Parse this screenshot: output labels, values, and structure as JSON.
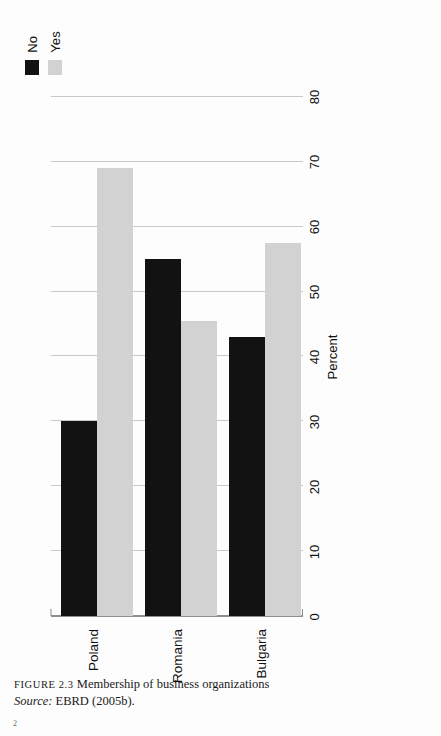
{
  "caption": {
    "figure_label": "FIGURE 2.3",
    "title": "Membership of business organizations",
    "source_label": "Source:",
    "source_text": "EBRD (2005b).",
    "folio": "2"
  },
  "legend": {
    "position": "top-right",
    "items": [
      {
        "label": "No",
        "color": "#121212"
      },
      {
        "label": "Yes",
        "color": "#d2d2d2"
      }
    ]
  },
  "axis": {
    "title": "Percent",
    "ticks": [
      "0",
      "10",
      "20",
      "30",
      "40",
      "50",
      "60",
      "70",
      "80"
    ]
  },
  "chart_data": {
    "type": "bar",
    "orientation": "horizontal",
    "title": "Membership of business organizations",
    "xlabel": "Percent",
    "ylabel": "",
    "xlim": [
      0,
      80
    ],
    "grid": true,
    "legend_position": "top right",
    "categories": [
      "Poland",
      "Romania",
      "Bulgaria"
    ],
    "series": [
      {
        "name": "No",
        "color": "#121212",
        "values": [
          30,
          55,
          43
        ]
      },
      {
        "name": "Yes",
        "color": "#d2d2d2",
        "values": [
          69,
          45.5,
          57.5
        ]
      }
    ]
  }
}
